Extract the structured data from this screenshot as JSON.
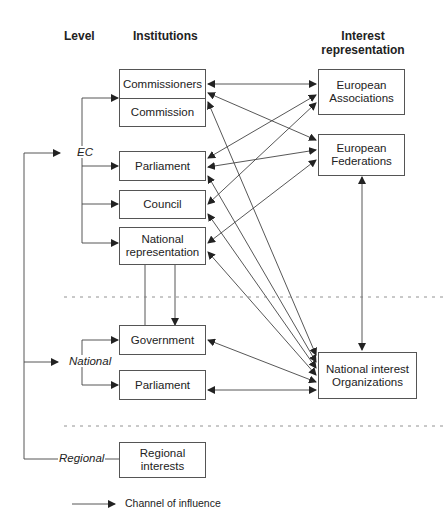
{
  "headers": {
    "level": "Level",
    "institutions": "Institutions",
    "interest": "Interest representation"
  },
  "levels": {
    "ec": "EC",
    "national": "National",
    "regional": "Regional"
  },
  "institutions": {
    "commissioners": "Commissioners",
    "commission": "Commission",
    "parliament_ec": "Parliament",
    "council": "Council",
    "national_rep": "National representation",
    "government": "Government",
    "parliament_nat": "Parliament",
    "regional": "Regional interests"
  },
  "interests": {
    "eu_associations": "European Associations",
    "eu_federations": "European Federations",
    "national_orgs": "National interest Organizations"
  },
  "legend": {
    "label": "Channel of influence"
  }
}
